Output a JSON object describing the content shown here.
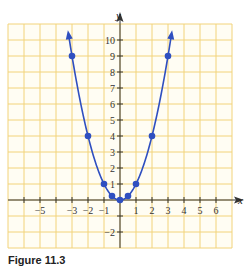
{
  "chart_data": {
    "type": "line",
    "title": "",
    "xlabel": "x",
    "ylabel": "y",
    "xlim": [
      -7,
      7
    ],
    "ylim": [
      -3,
      11
    ],
    "grid": true,
    "x_tick_labels": [
      "−5",
      "−3",
      "−2",
      "−1",
      "1",
      "2",
      "3",
      "4",
      "5",
      "6"
    ],
    "x_tick_values": [
      -5,
      -3,
      -2,
      -1,
      1,
      2,
      3,
      4,
      5,
      6
    ],
    "y_tick_labels": [
      "10",
      "9",
      "8",
      "7",
      "6",
      "5",
      "4",
      "3",
      "2",
      "1",
      "−2"
    ],
    "y_tick_values": [
      10,
      9,
      8,
      7,
      6,
      5,
      4,
      3,
      2,
      1,
      -2
    ],
    "series": [
      {
        "name": "y = x^2",
        "function": "x^2",
        "points": [
          {
            "x": -3,
            "y": 9
          },
          {
            "x": -2,
            "y": 4
          },
          {
            "x": -1,
            "y": 1
          },
          {
            "x": -0.5,
            "y": 0.25
          },
          {
            "x": 0,
            "y": 0
          },
          {
            "x": 0.5,
            "y": 0.25
          },
          {
            "x": 1,
            "y": 1
          },
          {
            "x": 2,
            "y": 4
          },
          {
            "x": 3,
            "y": 9
          }
        ],
        "arrows_at_ends": true
      }
    ]
  },
  "colors": {
    "grid": "#f2d37a",
    "grid_bg": "#fffcee",
    "curve": "#2f4fc0",
    "axis": "#333333"
  },
  "caption": "Figure 11.3"
}
